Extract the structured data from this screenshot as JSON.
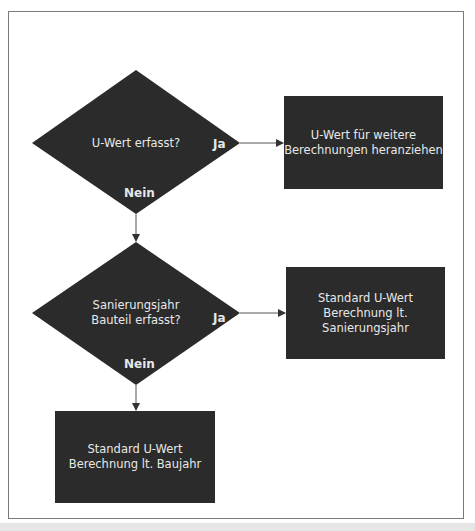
{
  "diagram": {
    "decisions": [
      {
        "id": "d1",
        "lines": [
          "U-Wert erfasst?"
        ],
        "yes_label": "Ja",
        "no_label": "Nein"
      },
      {
        "id": "d2",
        "lines": [
          "Sanierungsjahr",
          "Bauteil erfasst?"
        ],
        "yes_label": "Ja",
        "no_label": "Nein"
      }
    ],
    "processes": [
      {
        "id": "p1",
        "lines": [
          "U-Wert für weitere",
          "Berechnungen heranziehen"
        ]
      },
      {
        "id": "p2",
        "lines": [
          "Standard U-Wert",
          "Berechnung lt.",
          "Sanierungsjahr"
        ]
      },
      {
        "id": "p3",
        "lines": [
          "Standard U-Wert",
          "Berechnung lt. Baujahr"
        ]
      }
    ],
    "edges": [
      {
        "from": "d1",
        "to": "p1",
        "label": "Ja"
      },
      {
        "from": "d1",
        "to": "d2",
        "label": "Nein"
      },
      {
        "from": "d2",
        "to": "p2",
        "label": "Ja"
      },
      {
        "from": "d2",
        "to": "p3",
        "label": "Nein"
      }
    ],
    "colors": {
      "node_fill": "#2b2b2b",
      "node_text": "#e8e8e8",
      "edge": "#333333",
      "frame": "#7a7a7a"
    }
  }
}
